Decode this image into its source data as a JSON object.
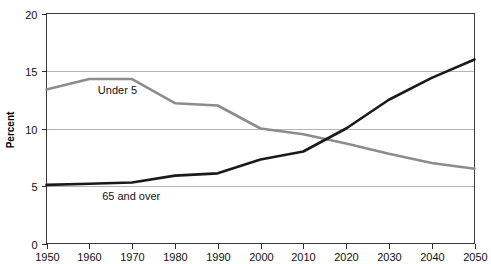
{
  "chart_data": {
    "type": "line",
    "title": "",
    "xlabel": "",
    "ylabel": "Percent",
    "xlim": [
      1950,
      2050
    ],
    "ylim": [
      0,
      20
    ],
    "yticks": [
      0,
      5,
      10,
      15,
      20
    ],
    "xticks": [
      1950,
      1960,
      1970,
      1980,
      1990,
      2000,
      2010,
      2020,
      2030,
      2040,
      2050
    ],
    "grid": "horizontal",
    "legend": "inline-labels",
    "x": [
      1950,
      1960,
      1970,
      1980,
      1990,
      2000,
      2010,
      2020,
      2030,
      2040,
      2050
    ],
    "series": [
      {
        "name": "Under 5",
        "color": "#8c8c8c",
        "values": [
          13.4,
          14.3,
          14.3,
          12.2,
          12.0,
          10.0,
          9.5,
          8.7,
          7.8,
          7.0,
          6.5
        ]
      },
      {
        "name": "65 and over",
        "color": "#1a1a1a",
        "values": [
          5.1,
          5.2,
          5.3,
          5.9,
          6.1,
          7.3,
          8.0,
          10.0,
          12.5,
          14.4,
          16.0
        ]
      }
    ],
    "annotations": [
      {
        "text": "Under 5",
        "x": 1962,
        "y": 13.0
      },
      {
        "text": "65 and over",
        "x": 1963,
        "y": 3.8
      }
    ]
  },
  "axis": {
    "y_tick_labels": [
      "0",
      "5",
      "10",
      "15",
      "20"
    ],
    "x_tick_labels": [
      "1950",
      "1960",
      "1970",
      "1980",
      "1990",
      "2000",
      "2010",
      "2020",
      "2030",
      "2040",
      "2050"
    ],
    "y_axis_title": "Percent"
  },
  "colors": {
    "under_5_line": "#8c8c8c",
    "over_65_line": "#1a1a1a",
    "gridline": "#b4b4b4",
    "frame": "#3a3a3a",
    "background": "#ffffff"
  }
}
